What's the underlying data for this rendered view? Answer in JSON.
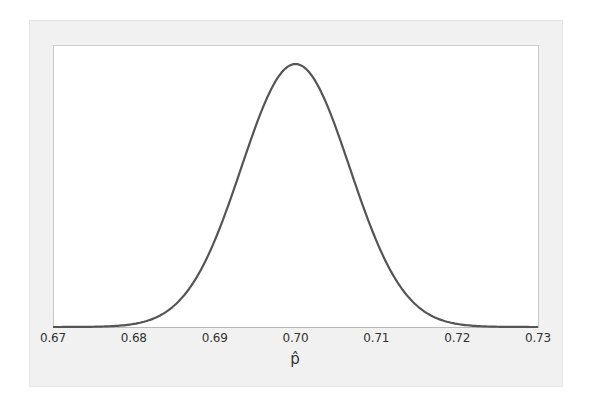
{
  "chart_data": {
    "type": "line",
    "title": "",
    "xlabel": "p̂",
    "ylabel": "",
    "xlim": [
      0.67,
      0.73
    ],
    "ylim": [
      0,
      1
    ],
    "grid": false,
    "legend": null,
    "x_ticks": [
      "0.67",
      "0.68",
      "0.69",
      "0.70",
      "0.71",
      "0.72",
      "0.73"
    ],
    "y_ticks": [],
    "distribution": {
      "family": "normal",
      "mean": 0.7,
      "sd": 0.0067
    },
    "series": [
      {
        "name": "density",
        "x": [
          0.67,
          0.675,
          0.68,
          0.685,
          0.69,
          0.695,
          0.7,
          0.705,
          0.71,
          0.715,
          0.72,
          0.725,
          0.73
        ],
        "values": [
          4e-05,
          0.0009,
          0.0115,
          0.0815,
          0.328,
          0.757,
          1.0,
          0.757,
          0.328,
          0.0815,
          0.0115,
          0.0009,
          4e-05
        ]
      }
    ],
    "line_color": "#555555"
  },
  "axis": {
    "x_label": "p̂"
  }
}
